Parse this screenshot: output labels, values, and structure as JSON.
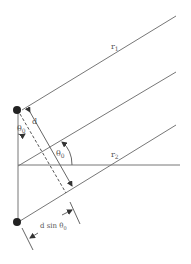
{
  "diagram": {
    "labels": {
      "r1": "r",
      "r1_sub": "1",
      "r2": "r",
      "r2_sub": "2",
      "d": "d",
      "theta_top": "θ",
      "theta_top_sub": "0",
      "theta_mid": "θ",
      "theta_mid_sub": "0",
      "dsin": "d sin θ",
      "dsin_sub": "0"
    },
    "colors": {
      "line": "#777777",
      "dot": "#222222",
      "text": "#555555"
    }
  }
}
